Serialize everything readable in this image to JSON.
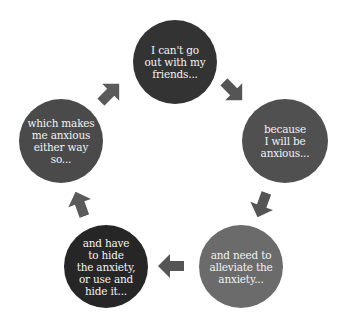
{
  "diagram": {
    "type": "cycle",
    "nodes": [
      {
        "id": "n1",
        "text": "I can't go\nout with my\nfriends...",
        "color": "#333333"
      },
      {
        "id": "n2",
        "text": "because\nI will be\nanxious...",
        "color": "#505050"
      },
      {
        "id": "n3",
        "text": "and need to\nalleviate the\nanxiety...",
        "color": "#6b6b6b"
      },
      {
        "id": "n4",
        "text": "and have\nto hide\nthe anxiety,\nor use and\nhide it...",
        "color": "#262626"
      },
      {
        "id": "n5",
        "text": "which makes\nme anxious\neither way\nso...",
        "color": "#4a4a4a"
      }
    ],
    "edges": [
      {
        "from": "n1",
        "to": "n2",
        "color": "#555555"
      },
      {
        "from": "n2",
        "to": "n3",
        "color": "#555555"
      },
      {
        "from": "n3",
        "to": "n4",
        "color": "#555555"
      },
      {
        "from": "n4",
        "to": "n5",
        "color": "#5a5a5a"
      },
      {
        "from": "n5",
        "to": "n1",
        "color": "#5a5a5a"
      }
    ]
  }
}
